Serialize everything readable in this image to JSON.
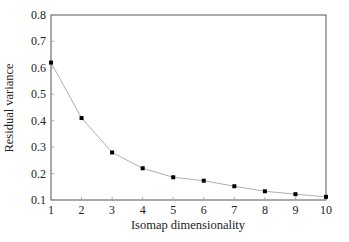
{
  "chart_data": {
    "type": "line",
    "title": "",
    "xlabel": "Isomap dimensionality",
    "ylabel": "Residual variance",
    "x": [
      1,
      2,
      3,
      4,
      5,
      6,
      7,
      8,
      9,
      10
    ],
    "series": [
      {
        "name": "Residual variance",
        "values": [
          0.62,
          0.41,
          0.28,
          0.22,
          0.186,
          0.173,
          0.152,
          0.133,
          0.122,
          0.112
        ],
        "line_color": "#b0b0b0",
        "marker_color": "#000000",
        "marker": "square"
      }
    ],
    "xlim": [
      1,
      10
    ],
    "ylim": [
      0.1,
      0.8
    ],
    "xticks": [
      1,
      2,
      3,
      4,
      5,
      6,
      7,
      8,
      9,
      10
    ],
    "yticks": [
      0.1,
      0.2,
      0.3,
      0.4,
      0.5,
      0.6,
      0.7,
      0.8
    ],
    "ytick_labels": [
      "0.1",
      "0.2",
      "0.3",
      "0.4",
      "0.5",
      "0.6",
      "0.7",
      "0.8"
    ],
    "xtick_labels": [
      "1",
      "2",
      "3",
      "4",
      "5",
      "6",
      "7",
      "8",
      "9",
      "10"
    ],
    "grid": false,
    "legend": null,
    "frame": "box"
  },
  "colors": {
    "frame": "#555555",
    "text": "#222222",
    "line": "#b0b0b0",
    "marker": "#000000"
  }
}
